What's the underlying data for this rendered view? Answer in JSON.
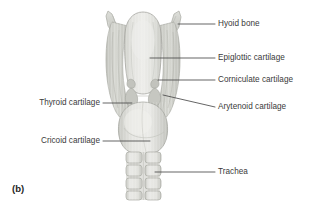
{
  "figure": {
    "panel_letter": "(b)",
    "background_color": "#ffffff",
    "label_color": "#3a3a3a",
    "leader_color": "#4a4a4a"
  },
  "labels": {
    "hyoid_bone": "Hyoid bone",
    "epiglottic_cartilage": "Epiglottic cartilage",
    "corniculate_cartilage": "Corniculate cartilage",
    "arytenoid_cartilage": "Arytenoid cartilage",
    "thyroid_cartilage": "Thyroid cartilage",
    "cricoid_cartilage": "Cricoid cartilage",
    "trachea": "Trachea"
  },
  "anatomy_parts": [
    {
      "name": "hyoid-bone",
      "side": "right",
      "fill": "#d2d3cd"
    },
    {
      "name": "epiglottic-cartilage",
      "side": "right",
      "fill": "#dcdcd7"
    },
    {
      "name": "corniculate-cartilage",
      "side": "right",
      "fill": "#c7c8c2"
    },
    {
      "name": "arytenoid-cartilage",
      "side": "right",
      "fill": "#c4c5bf"
    },
    {
      "name": "thyroid-cartilage",
      "side": "left",
      "fill": "#cbccc6"
    },
    {
      "name": "cricoid-cartilage",
      "side": "left",
      "fill": "#d9d9d4"
    },
    {
      "name": "trachea",
      "side": "right",
      "fill": "#e2e2de"
    }
  ],
  "palette": {
    "light_fill": "#e4e4e0",
    "mid_fill": "#cdcec8",
    "dark_fill": "#b8b9b3",
    "outline": "#a9aaa4",
    "shadow": "#9c9d97"
  }
}
